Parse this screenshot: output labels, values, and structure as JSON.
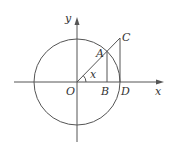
{
  "diagram": {
    "type": "unit-circle-trigonometric-lines",
    "colors": {
      "stroke": "#555555",
      "text": "#333333",
      "background": "#ffffff"
    },
    "axes": {
      "x_label": "x",
      "y_label": "y"
    },
    "points": {
      "O": "O",
      "A": "A",
      "B": "B",
      "C": "C",
      "D": "D"
    },
    "angle_label": "x"
  }
}
